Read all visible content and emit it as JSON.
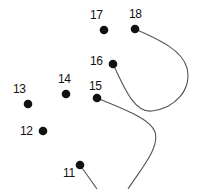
{
  "dots": [
    {
      "n": "11",
      "x": 80,
      "y": 165,
      "lx": 63,
      "ly": 167
    },
    {
      "n": "12",
      "x": 43,
      "y": 131,
      "lx": 20,
      "ly": 125
    },
    {
      "n": "13",
      "x": 28,
      "y": 104,
      "lx": 13,
      "ly": 83
    },
    {
      "n": "14",
      "x": 66,
      "y": 94,
      "lx": 58,
      "ly": 73
    },
    {
      "n": "15",
      "x": 97,
      "y": 98,
      "lx": 89,
      "ly": 80
    },
    {
      "n": "16",
      "x": 113,
      "y": 64,
      "lx": 90,
      "ly": 55
    },
    {
      "n": "17",
      "x": 104,
      "y": 30,
      "lx": 90,
      "ly": 9
    },
    {
      "n": "18",
      "x": 135,
      "y": 29,
      "lx": 129,
      "ly": 8
    }
  ],
  "colors": {
    "ink": "#111111",
    "line": "#555555"
  }
}
